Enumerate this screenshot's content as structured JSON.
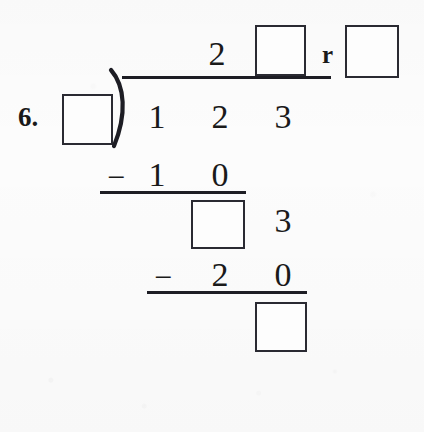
{
  "worksheet": {
    "problem_number": "6.",
    "operation": "long-division",
    "remainder_label": "r",
    "minus_sign": "−",
    "divisor": "",
    "dividend_digits": [
      "1",
      "2",
      "3"
    ],
    "quotient": {
      "known_digit": "2",
      "blank_digit": "",
      "remainder_blank": ""
    },
    "steps": [
      {
        "name": "first-subtraction",
        "minus": "−",
        "digits": [
          "1",
          "0"
        ]
      },
      {
        "name": "first-difference",
        "blank": "",
        "brought_down_digit": "3"
      },
      {
        "name": "second-subtraction",
        "minus": "−",
        "digits": [
          "2",
          "0"
        ]
      },
      {
        "name": "final-remainder",
        "blank": ""
      }
    ],
    "colors": {
      "ink": "#1d1d24",
      "box_border": "#2a2a32",
      "paper": "#fcfcfc"
    }
  }
}
